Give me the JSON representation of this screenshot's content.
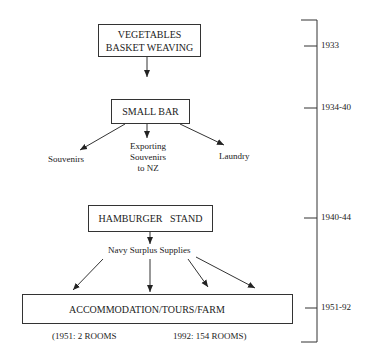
{
  "nodes": {
    "vegetables": {
      "line1": "VEGETABLES",
      "line2": "BASKET WEAVING"
    },
    "small_bar": {
      "label": "SMALL BAR"
    },
    "souvenirs": {
      "label": "Souvenirs"
    },
    "exporting": {
      "line1": "Exporting",
      "line2": "Souvenirs",
      "line3": "to NZ"
    },
    "laundry": {
      "label": "Laundry"
    },
    "hamburger": {
      "label": "HAMBURGER   STAND"
    },
    "navy": {
      "label": "Navy Surplus Supplies"
    },
    "accommodation": {
      "label": "ACCOMMODATION/TOURS/FARM"
    },
    "rooms_1951": {
      "label": "(1951: 2 ROOMS"
    },
    "rooms_1992": {
      "label": "1992: 154 ROOMS)"
    }
  },
  "timeline": {
    "periods": [
      "1933",
      "1934-40",
      "1940-44",
      "1951-92"
    ]
  }
}
